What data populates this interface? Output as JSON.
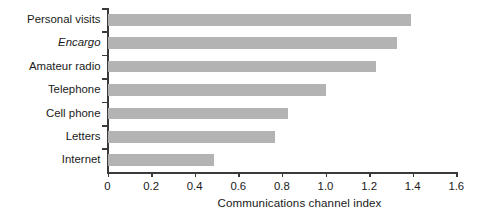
{
  "chart_data": {
    "type": "bar",
    "orientation": "horizontal",
    "title": "",
    "xlabel": "Communications channel index",
    "ylabel": "",
    "xlim": [
      0,
      1.6
    ],
    "xticks": [
      "0",
      "0.2",
      "0.4",
      "0.6",
      "0.8",
      "1.0",
      "1.2",
      "1.4",
      "1.6"
    ],
    "xtick_values": [
      0,
      0.2,
      0.4,
      0.6,
      0.8,
      1.0,
      1.2,
      1.4,
      1.6
    ],
    "grid": false,
    "legend": null,
    "bar_color": "#b3b3b3",
    "axis_color": "#3a3a3a",
    "categories": [
      "Personal visits",
      "Encargo",
      "Amateur radio",
      "Telephone",
      "Cell phone",
      "Letters",
      "Internet"
    ],
    "values": [
      1.39,
      1.33,
      1.23,
      1.0,
      0.83,
      0.77,
      0.49
    ],
    "bars": [
      {
        "label": "Personal visits",
        "value": 1.39,
        "italic": false
      },
      {
        "label": "Encargo",
        "value": 1.33,
        "italic": true
      },
      {
        "label": "Amateur radio",
        "value": 1.23,
        "italic": false
      },
      {
        "label": "Telephone",
        "value": 1.0,
        "italic": false
      },
      {
        "label": "Cell phone",
        "value": 0.83,
        "italic": false
      },
      {
        "label": "Letters",
        "value": 0.77,
        "italic": false
      },
      {
        "label": "Internet",
        "value": 0.49,
        "italic": false
      }
    ]
  }
}
